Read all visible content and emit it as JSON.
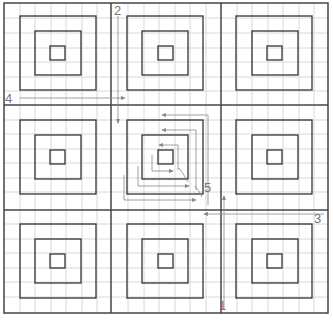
{
  "diagram": {
    "colors": {
      "background": "#ffffff",
      "grid": "#d8d8d8",
      "border": "#444444",
      "squares": "#333333",
      "arrows": "#888888",
      "labels": "#777777"
    },
    "labels": [
      {
        "id": "1",
        "text": "1",
        "x": 219,
        "y": 299
      },
      {
        "id": "2",
        "text": "2",
        "x": 114,
        "y": 4
      },
      {
        "id": "3",
        "text": "3",
        "x": 314,
        "y": 212
      },
      {
        "id": "4",
        "text": "4",
        "x": 5,
        "y": 92
      },
      {
        "id": "5",
        "text": "5",
        "x": 204,
        "y": 181
      }
    ]
  }
}
